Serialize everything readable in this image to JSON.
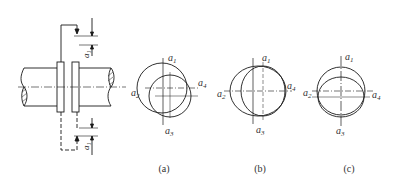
{
  "figure": {
    "subfigures": [
      {
        "id": "a",
        "caption": "(a)",
        "description": "two circles offset diagonally"
      },
      {
        "id": "b",
        "caption": "(b)",
        "description": "two circles offset horizontally"
      },
      {
        "id": "c",
        "caption": "(c)",
        "description": "two circles offset vertically"
      }
    ],
    "point_labels": {
      "a1": {
        "base": "a",
        "sub": "1"
      },
      "a2": {
        "base": "a",
        "sub": "2"
      },
      "a3": {
        "base": "a",
        "sub": "3"
      },
      "a4": {
        "base": "a",
        "sub": "4"
      }
    },
    "dimension_label": {
      "base": "a",
      "sub": "1"
    },
    "colors": {
      "line": "#1a1a1a",
      "text": "#333333",
      "background": "#ffffff"
    }
  }
}
